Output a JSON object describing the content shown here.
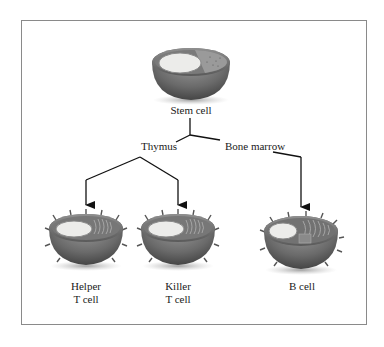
{
  "diagram": {
    "type": "lineage-tree",
    "nodes": {
      "stem_cell": {
        "label": "Stem cell"
      },
      "thymus": {
        "label": "Thymus"
      },
      "bone_marrow": {
        "label": "Bone marrow"
      },
      "helper_t_cell": {
        "line1": "Helper",
        "line2": "T cell"
      },
      "killer_t_cell": {
        "line1": "Killer",
        "line2": "T cell"
      },
      "b_cell": {
        "label": "B cell"
      }
    },
    "edges": [
      {
        "from": "Stem cell",
        "to": "Thymus"
      },
      {
        "from": "Stem cell",
        "to": "Bone marrow"
      },
      {
        "from": "Thymus",
        "to": "Helper T cell"
      },
      {
        "from": "Thymus",
        "to": "Killer T cell"
      },
      {
        "from": "Bone marrow",
        "to": "B cell"
      }
    ],
    "colors": {
      "frame": "#8a8a8a",
      "line": "#111111",
      "cell_shell": "#6e6e6e",
      "nucleus": "#e8e8e4"
    }
  }
}
